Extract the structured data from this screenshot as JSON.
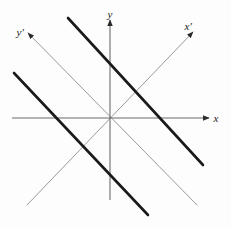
{
  "figure": {
    "background_color": "#fdfdfd",
    "width": 231,
    "height": 228,
    "origin": {
      "x": 110,
      "y": 118
    }
  },
  "labels": {
    "x": "x",
    "y": "y",
    "x_prime": "x′",
    "y_prime": "y′"
  },
  "colors": {
    "primary_axis": "#6b6b6b",
    "rotated_axis": "#9a9a9a",
    "thick_line": "#1a1a1a",
    "label_text": "#1a1a1a",
    "background": "#fdfdfd"
  },
  "chart_data": {
    "type": "line",
    "xlabel": "x",
    "ylabel": "y",
    "grid": false,
    "legend": false,
    "origin_px": {
      "x": 110,
      "y": 118
    },
    "axes": [
      {
        "name": "x",
        "label": "x",
        "kind": "primary",
        "angle_deg": 0,
        "arrow": "end",
        "color": "#6b6b6b",
        "stroke_width": 1.1,
        "from_px": {
          "x": 12,
          "y": 118
        },
        "to_px": {
          "x": 209,
          "y": 118
        },
        "label_px": {
          "x": 216,
          "y": 118
        }
      },
      {
        "name": "y",
        "label": "y",
        "kind": "primary",
        "angle_deg": 90,
        "arrow": "end",
        "color": "#6b6b6b",
        "stroke_width": 1.1,
        "from_px": {
          "x": 110,
          "y": 200
        },
        "to_px": {
          "x": 110,
          "y": 20
        },
        "label_px": {
          "x": 110,
          "y": 14
        }
      },
      {
        "name": "x-prime",
        "label": "x′",
        "kind": "rotated",
        "angle_deg": 45,
        "arrow": "end",
        "color": "#9a9a9a",
        "stroke_width": 1.0,
        "from_px": {
          "x": 27,
          "y": 205
        },
        "to_px": {
          "x": 193,
          "y": 32
        },
        "label_px": {
          "x": 188,
          "y": 26
        }
      },
      {
        "name": "y-prime",
        "label": "y′",
        "kind": "rotated",
        "angle_deg": 135,
        "arrow": "end",
        "color": "#9a9a9a",
        "stroke_width": 1.0,
        "from_px": {
          "x": 197,
          "y": 205
        },
        "to_px": {
          "x": 28,
          "y": 33
        },
        "label_px": {
          "x": 20,
          "y": 32
        }
      }
    ],
    "lines": [
      {
        "name": "thick-line-upper",
        "slope": -1,
        "color": "#1a1a1a",
        "stroke_width": 2.6,
        "from_px": {
          "x": 68,
          "y": 18
        },
        "to_px": {
          "x": 203,
          "y": 165
        }
      },
      {
        "name": "thick-line-lower",
        "slope": -1,
        "color": "#1a1a1a",
        "stroke_width": 2.6,
        "from_px": {
          "x": 14,
          "y": 73
        },
        "to_px": {
          "x": 148,
          "y": 215
        }
      }
    ],
    "rotation_deg": 45
  }
}
